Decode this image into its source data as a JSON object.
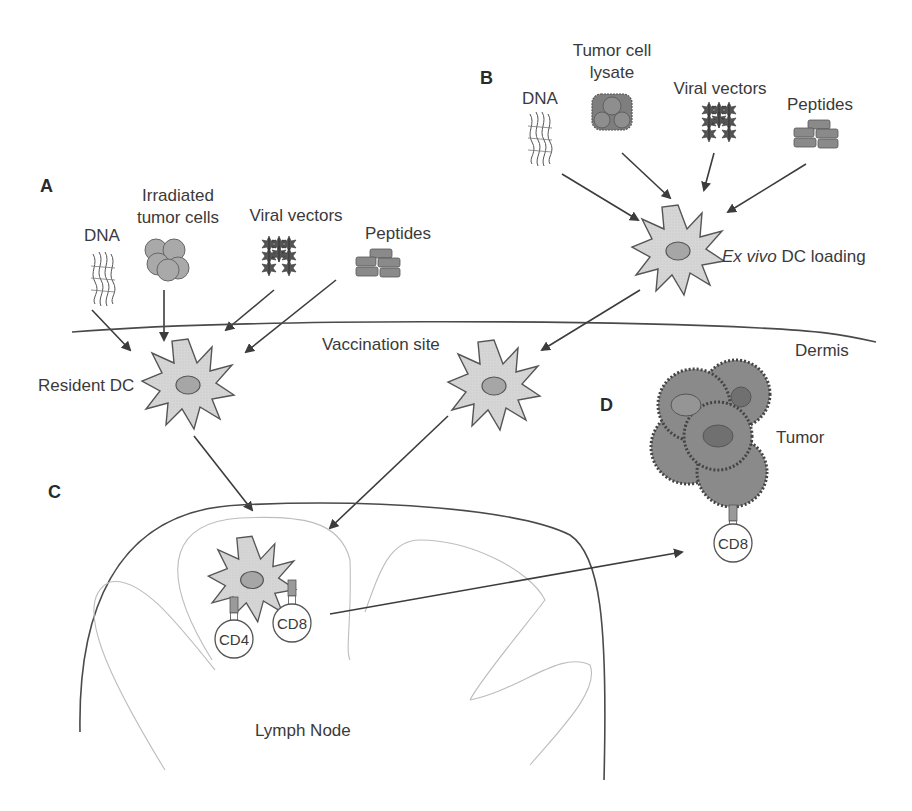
{
  "figure": {
    "panels": {
      "A": {
        "label": "A",
        "x": 40,
        "y": 192
      },
      "B": {
        "label": "B",
        "x": 480,
        "y": 84
      },
      "C": {
        "label": "C",
        "x": 48,
        "y": 498
      },
      "D": {
        "label": "D",
        "x": 600,
        "y": 411
      }
    },
    "panel_a": {
      "antigens": [
        {
          "name": "dna",
          "label_lines": [
            "DNA"
          ],
          "label_x": 102,
          "label_y": 241,
          "icon": "dna-icon",
          "icon_x": 103,
          "icon_y": 278
        },
        {
          "name": "irradiated-tumor-cells",
          "label_lines": [
            "Irradiated",
            "tumor cells"
          ],
          "label_x": 178,
          "label_y": 201,
          "icon": "tumor-cells-icon",
          "icon_x": 164,
          "icon_y": 258
        },
        {
          "name": "viral-vectors",
          "label_lines": [
            "Viral vectors"
          ],
          "label_x": 296,
          "label_y": 221,
          "icon": "viral-vectors-icon",
          "icon_x": 279,
          "icon_y": 258
        },
        {
          "name": "peptides",
          "label_lines": [
            "Peptides"
          ],
          "label_x": 398,
          "label_y": 239,
          "icon": "peptides-icon",
          "icon_x": 378,
          "icon_y": 265
        }
      ],
      "dc_label": "Resident DC"
    },
    "panel_b": {
      "antigens": [
        {
          "name": "dna",
          "label_lines": [
            "DNA"
          ],
          "label_x": 540,
          "label_y": 104,
          "icon": "dna-icon",
          "icon_x": 540,
          "icon_y": 138
        },
        {
          "name": "tumor-cell-lysate",
          "label_lines": [
            "Tumor cell",
            "lysate"
          ],
          "label_x": 612,
          "label_y": 56,
          "icon": "lysate-icon",
          "icon_x": 612,
          "icon_y": 110
        },
        {
          "name": "viral-vectors",
          "label_lines": [
            "Viral vectors"
          ],
          "label_x": 720,
          "label_y": 94,
          "icon": "viral-vectors-icon",
          "icon_x": 705,
          "icon_y": 120
        },
        {
          "name": "peptides",
          "label_lines": [
            "Peptides"
          ],
          "label_x": 820,
          "label_y": 110,
          "icon": "peptides-icon",
          "icon_x": 816,
          "icon_y": 135
        }
      ],
      "dc_label_italic": "Ex vivo",
      "dc_label_rest": " DC loading"
    },
    "vaccination_site_label": "Vaccination site",
    "dermis_label": "Dermis",
    "lymph_node_label": "Lymph Node",
    "tumor_label": "Tumor",
    "t_cells": {
      "cd4": "CD4",
      "cd8_ln": "CD8",
      "cd8_tumor": "CD8"
    },
    "colors": {
      "dc_fill": "#d9d9d9",
      "nucleus_fill": "#a6a6a6",
      "tumor_fill": "#8a8a8a",
      "tumor_nucleus": "#707070",
      "line": "#3c3c3c",
      "follicle": "#bdbdbd"
    }
  }
}
